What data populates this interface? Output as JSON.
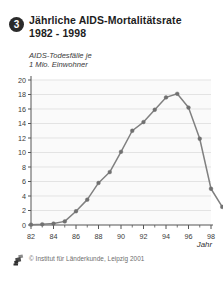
{
  "header": {
    "badge_number": "3",
    "title_line1": "Jährliche  AIDS-Mortalitätsrate",
    "title_line2": "1982 - 1998",
    "subtitle_line1": "AIDS-Todesfälle je",
    "subtitle_line2": "1 Mio. Einwohner"
  },
  "footer": {
    "credit": "© Institut für Länderkunde, Leipzig 2001",
    "logo_icon": "institut-logo-icon"
  },
  "axis_caption": "Jahr",
  "colors": {
    "line": "#808080",
    "marker": "#707070",
    "axis": "#555555",
    "grid": "#d8d8d8",
    "plot_background": "#fafafa",
    "badge": "#2b2b2b",
    "title_text": "#1d1d1d",
    "credit_text": "#6d6d6d"
  },
  "chart_data": {
    "type": "line",
    "xlabel": "Jahr",
    "ylabel": "AIDS-Todesfälle je 1 Mio. Einwohner",
    "xlim": [
      1982,
      1998
    ],
    "ylim": [
      0,
      20
    ],
    "grid": true,
    "legend": "none",
    "x": [
      1982,
      1983,
      1984,
      1985,
      1986,
      1987,
      1988,
      1989,
      1990,
      1991,
      1992,
      1993,
      1994,
      1995,
      1996,
      1997,
      1998
    ],
    "values": [
      0.05,
      0.1,
      0.2,
      0.5,
      1.9,
      3.5,
      5.8,
      7.3,
      10.1,
      13.0,
      14.2,
      15.9,
      17.6,
      18.1,
      16.2,
      11.9,
      5.0
    ],
    "x_tick_labels": [
      "82",
      "84",
      "86",
      "88",
      "90",
      "92",
      "94",
      "96",
      "98"
    ],
    "x_tick_values": [
      1982,
      1984,
      1986,
      1988,
      1990,
      1992,
      1994,
      1996,
      1998
    ],
    "x_minor_ticks": [
      1983,
      1985,
      1987,
      1989,
      1991,
      1993,
      1995,
      1997
    ],
    "y_tick_labels": [
      "0",
      "2",
      "4",
      "6",
      "8",
      "10",
      "12",
      "14",
      "16",
      "18",
      "20"
    ],
    "y_tick_values": [
      0,
      2,
      4,
      6,
      8,
      10,
      12,
      14,
      16,
      18,
      20
    ],
    "final_point_note": "1998 value 2.5 (curve end marker)",
    "x_end": 1999,
    "value_end": 2.5
  }
}
